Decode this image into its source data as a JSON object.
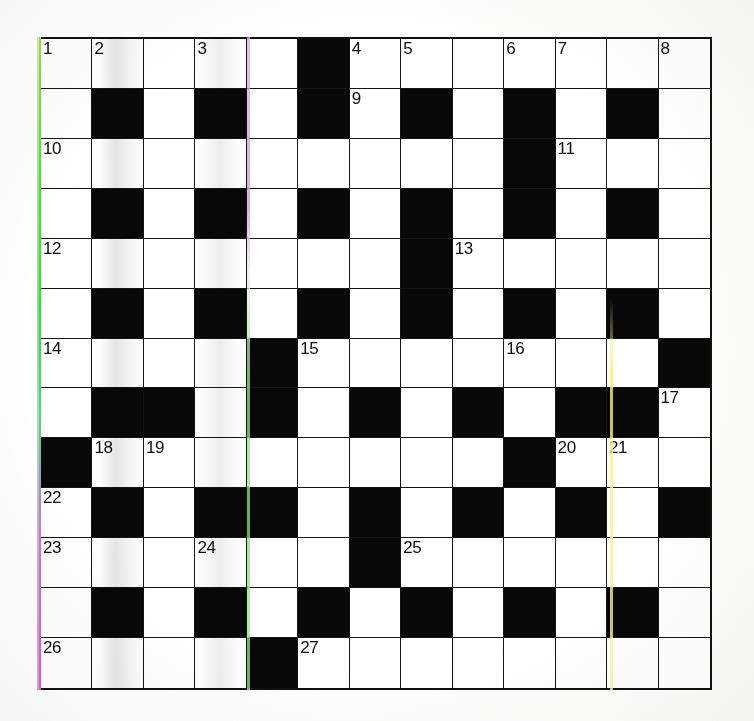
{
  "puzzle": {
    "title": "Crossword Grid",
    "columns": 13,
    "rows": 13,
    "colors": {
      "block": "#080808",
      "cell": "#ffffff",
      "grid_line": "#141414",
      "number_text": "#0d0d0d"
    },
    "grid": [
      [
        "w1",
        "w2",
        "w",
        "w3",
        "w",
        "b",
        "w4",
        "w5",
        "w",
        "w6",
        "w7",
        "w",
        "w8"
      ],
      [
        "w",
        "b",
        "w",
        "b",
        "w",
        "b",
        "w9",
        "b",
        "w",
        "b",
        "w",
        "b",
        "w"
      ],
      [
        "w10",
        "w",
        "w",
        "w",
        "w",
        "w",
        "w",
        "w",
        "w",
        "b",
        "w11",
        "w",
        "w"
      ],
      [
        "w",
        "b",
        "w",
        "b",
        "w",
        "b",
        "w",
        "b",
        "w",
        "b",
        "w",
        "b",
        "w"
      ],
      [
        "w12",
        "w",
        "w",
        "w",
        "w",
        "w",
        "w",
        "b",
        "w13",
        "w",
        "w",
        "w",
        "w"
      ],
      [
        "w",
        "b",
        "w",
        "b",
        "w",
        "b",
        "w",
        "b",
        "w",
        "b",
        "w",
        "b",
        "w"
      ],
      [
        "w14",
        "w",
        "w",
        "w",
        "b",
        "w15",
        "w",
        "w",
        "w",
        "w16",
        "w",
        "w",
        "b"
      ],
      [
        "w",
        "b",
        "b",
        "w",
        "b",
        "w",
        "b",
        "w",
        "b",
        "w",
        "b",
        "b",
        "w17"
      ],
      [
        "b",
        "w18",
        "w19",
        "w",
        "w",
        "w",
        "w",
        "w",
        "w",
        "b",
        "w20",
        "w21",
        "w"
      ],
      [
        "w22",
        "b",
        "w",
        "b",
        "b",
        "w",
        "b",
        "w",
        "b",
        "w",
        "b",
        "w",
        "b"
      ],
      [
        "w23",
        "w",
        "w",
        "w24",
        "w",
        "w",
        "b",
        "w25",
        "w",
        "w",
        "w",
        "w",
        "w"
      ],
      [
        "w",
        "b",
        "w",
        "b",
        "w",
        "b",
        "w",
        "b",
        "w",
        "b",
        "w",
        "b",
        "w"
      ],
      [
        "w26",
        "w",
        "w",
        "w",
        "b",
        "w27",
        "w",
        "w",
        "w",
        "w",
        "w",
        "w",
        "w"
      ],
      [
        "w",
        "b",
        "w",
        "b",
        "w",
        "b",
        "w",
        "b",
        "w",
        "b",
        "w",
        "b",
        "w"
      ],
      [
        "w28",
        "w",
        "w",
        "w",
        "w",
        "w",
        "w",
        "b",
        "w29",
        "w",
        "w",
        "w",
        "w"
      ]
    ],
    "clue_numbers": [
      {
        "n": "1",
        "row": 1,
        "col": 1
      },
      {
        "n": "2",
        "row": 1,
        "col": 2
      },
      {
        "n": "3",
        "row": 1,
        "col": 4
      },
      {
        "n": "4",
        "row": 1,
        "col": 7
      },
      {
        "n": "5",
        "row": 1,
        "col": 8
      },
      {
        "n": "6",
        "row": 1,
        "col": 10
      },
      {
        "n": "7",
        "row": 1,
        "col": 11
      },
      {
        "n": "8",
        "row": 1,
        "col": 13
      },
      {
        "n": "9",
        "row": 2,
        "col": 7
      },
      {
        "n": "10",
        "row": 3,
        "col": 1
      },
      {
        "n": "11",
        "row": 3,
        "col": 11
      },
      {
        "n": "12",
        "row": 5,
        "col": 1
      },
      {
        "n": "13",
        "row": 5,
        "col": 9
      },
      {
        "n": "14",
        "row": 7,
        "col": 1
      },
      {
        "n": "15",
        "row": 7,
        "col": 6
      },
      {
        "n": "16",
        "row": 7,
        "col": 10
      },
      {
        "n": "17",
        "row": 8,
        "col": 13
      },
      {
        "n": "18",
        "row": 9,
        "col": 2
      },
      {
        "n": "19",
        "row": 9,
        "col": 3
      },
      {
        "n": "20",
        "row": 9,
        "col": 11
      },
      {
        "n": "21",
        "row": 9,
        "col": 12
      },
      {
        "n": "22",
        "row": 10,
        "col": 1
      },
      {
        "n": "23",
        "row": 11,
        "col": 1
      },
      {
        "n": "24",
        "row": 11,
        "col": 4
      },
      {
        "n": "25",
        "row": 11,
        "col": 8
      },
      {
        "n": "26",
        "row": 13,
        "col": 1
      },
      {
        "n": "27",
        "row": 13,
        "col": 6
      },
      {
        "n": "28",
        "row": 15,
        "col": 1
      },
      {
        "n": "29",
        "row": 15,
        "col": 9
      }
    ]
  }
}
